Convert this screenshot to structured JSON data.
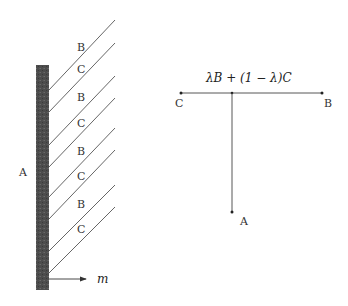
{
  "left_figure": {
    "wall_label": "A",
    "stripe_labels": [
      "B",
      "C",
      "B",
      "C",
      "B",
      "C",
      "B",
      "C"
    ],
    "arrow_label": "m",
    "wall_color": "#4a4a4a"
  },
  "right_figure": {
    "segment_label": "λB + (1 − λ)C",
    "left_end_label": "C",
    "right_end_label": "B",
    "bottom_point_label": "A"
  }
}
